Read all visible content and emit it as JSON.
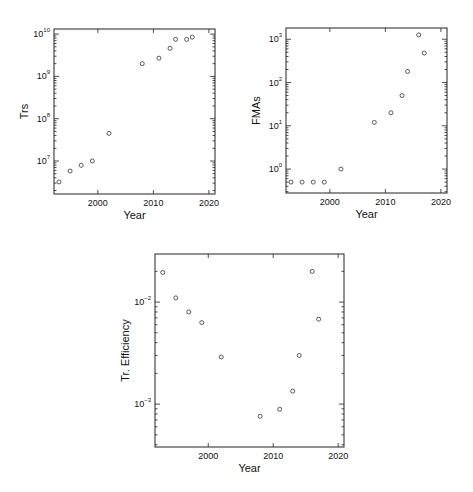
{
  "chart_data": [
    {
      "type": "scatter",
      "id": "trs",
      "title": "",
      "xlabel": "Year",
      "ylabel": "Trs",
      "yscale": "log",
      "xlim": [
        1992.1,
        2021.1
      ],
      "ylim": [
        1660000,
        13200000000
      ],
      "xticks": [
        2000,
        2010,
        2020
      ],
      "xtick_labels": [
        "2000",
        "2010",
        "2020"
      ],
      "yticks": [
        7,
        8,
        9,
        10
      ],
      "ytick_labels": [
        "10",
        "10",
        "10",
        "10"
      ],
      "ytick_exponents": [
        "7",
        "8",
        "9",
        "10"
      ],
      "x": [
        1993,
        1995,
        1997,
        1999,
        2002,
        2008,
        2011,
        2013,
        2014,
        2016,
        2017
      ],
      "y": [
        3200000,
        5800000,
        7900000,
        10000000,
        45000000,
        2000000000,
        2700000000,
        4600000000,
        7500000000,
        7500000000,
        8500000000
      ],
      "marker": "open-circle"
    },
    {
      "type": "scatter",
      "id": "fmas",
      "title": "",
      "xlabel": "Year",
      "ylabel": "FMAs",
      "yscale": "log",
      "xlim": [
        1992.1,
        2021.1
      ],
      "ylim": [
        0.28,
        1820
      ],
      "xticks": [
        2000,
        2010,
        2020
      ],
      "xtick_labels": [
        "2000",
        "2010",
        "2020"
      ],
      "yticks": [
        0,
        1,
        2,
        3
      ],
      "ytick_labels": [
        "10",
        "10",
        "10",
        "10"
      ],
      "ytick_exponents": [
        "0",
        "1",
        "2",
        "3"
      ],
      "x": [
        1993,
        1995,
        1997,
        1999,
        2002,
        2008,
        2011,
        2013,
        2014,
        2016,
        2017
      ],
      "y": [
        0.5,
        0.5,
        0.5,
        0.5,
        1.0,
        12,
        20,
        50,
        180,
        1260,
        480
      ],
      "marker": "open-circle"
    },
    {
      "type": "scatter",
      "id": "efficiency",
      "title": "",
      "xlabel": "Year",
      "ylabel": "Tr. Efficiency",
      "yscale": "log",
      "xlim": [
        1991.8,
        2020.9
      ],
      "ylim": [
        0.00038,
        0.0296
      ],
      "xticks": [
        2000,
        2010,
        2020
      ],
      "xtick_labels": [
        "2000",
        "2010",
        "2020"
      ],
      "yticks": [
        -3,
        -2
      ],
      "ytick_labels": [
        "10",
        "10"
      ],
      "ytick_exponents": [
        "−3",
        "−2"
      ],
      "x": [
        1993,
        1995,
        1997,
        1999,
        2002,
        2008,
        2011,
        2013,
        2014,
        2016,
        2017
      ],
      "y": [
        0.0195,
        0.011,
        0.008,
        0.0063,
        0.0029,
        0.00076,
        0.00089,
        0.00134,
        0.003,
        0.02,
        0.0068
      ],
      "marker": "open-circle"
    }
  ]
}
